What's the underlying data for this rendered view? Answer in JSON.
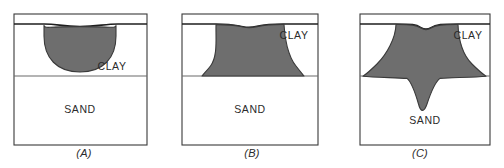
{
  "figure": {
    "title": "",
    "width": 504,
    "height": 168,
    "background": "#ffffff",
    "stroke_color": "#3a3a3a",
    "fill_gray": "#6e6e6e",
    "text_color": "#2b2b2b"
  },
  "panels": [
    {
      "id": "A",
      "caption": "(A)",
      "frame": {
        "x": 14,
        "y": 14,
        "width": 133,
        "height": 131
      },
      "surface_line_y": 24,
      "layer_boundary_y": 76,
      "layers": [
        {
          "name": "clay",
          "label": "CLAY",
          "label_x": 112,
          "label_y": 70,
          "top_y": 24,
          "bottom_y": 76
        },
        {
          "name": "sand",
          "label": "SAND",
          "label_x": 80,
          "label_y": 113,
          "top_y": 76,
          "bottom_y": 145
        }
      ],
      "plume": {
        "shape": "hemispherical-bulb",
        "description": "Shallow rounded plume contained entirely within the clay layer",
        "penetrates_sand": false,
        "surface_depression": "slight"
      }
    },
    {
      "id": "B",
      "caption": "(B)",
      "frame": {
        "x": 182,
        "y": 14,
        "width": 136,
        "height": 131
      },
      "surface_line_y": 24,
      "layer_boundary_y": 76,
      "layers": [
        {
          "name": "clay",
          "label": "CLAY",
          "label_x": 290,
          "label_y": 39,
          "top_y": 24,
          "bottom_y": 76
        },
        {
          "name": "sand",
          "label": "SAND",
          "label_x": 250,
          "label_y": 113,
          "top_y": 76,
          "bottom_y": 145
        }
      ],
      "plume": {
        "shape": "flared-trapezoid",
        "description": "Plume spreads laterally and reaches down to the clay-sand interface",
        "penetrates_sand": false,
        "surface_depression": "moderate"
      }
    },
    {
      "id": "C",
      "caption": "(C)",
      "frame": {
        "x": 360,
        "y": 14,
        "width": 130,
        "height": 131
      },
      "surface_line_y": 24,
      "layer_boundary_y": 76,
      "layers": [
        {
          "name": "clay",
          "label": "CLAY",
          "label_x": 468,
          "label_y": 39,
          "top_y": 24,
          "bottom_y": 76
        },
        {
          "name": "sand",
          "label": "SAND",
          "label_x": 425,
          "label_y": 124,
          "top_y": 76,
          "bottom_y": 145
        }
      ],
      "plume": {
        "shape": "flared-with-downward-spike",
        "description": "Plume fills the clay layer edge to edge and breaks through into the sand as a tapering spike",
        "penetrates_sand": true,
        "surface_depression": "pronounced"
      }
    }
  ]
}
